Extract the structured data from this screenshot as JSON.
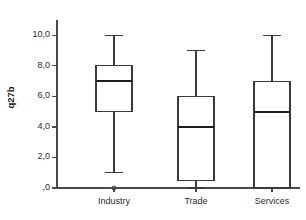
{
  "chart_data": {
    "type": "box",
    "title": "",
    "xlabel": "",
    "ylabel": "q27b",
    "ylim": [
      0,
      11
    ],
    "grid": false,
    "legend": "none",
    "decimal_separator": ",",
    "y_ticks": [
      {
        "value": 10,
        "label": "10,0"
      },
      {
        "value": 8,
        "label": "8,0"
      },
      {
        "value": 6,
        "label": "6,0"
      },
      {
        "value": 4,
        "label": "4,0"
      },
      {
        "value": 2,
        "label": "2,0"
      },
      {
        "value": 0,
        "label": ",0"
      }
    ],
    "categories": [
      "Industry",
      "Trade",
      "Services"
    ],
    "boxes": [
      {
        "category": "Industry",
        "whisker_low": 1.0,
        "q1": 5.0,
        "median": 7.0,
        "q3": 8.0,
        "whisker_high": 10.0,
        "outliers": [
          0.0
        ]
      },
      {
        "category": "Trade",
        "whisker_low": 0.0,
        "q1": 0.5,
        "median": 4.0,
        "q3": 6.0,
        "whisker_high": 9.0,
        "outliers": []
      },
      {
        "category": "Services",
        "whisker_low": 0.0,
        "q1": 0.0,
        "median": 5.0,
        "q3": 7.0,
        "whisker_high": 10.0,
        "outliers": []
      }
    ]
  },
  "axis_title": {
    "y": "q27b"
  },
  "colors": {
    "axis": "#4a4a4a",
    "box_stroke": "#3a3a3a",
    "box_fill": "#ffffff",
    "median": "#1c1c1c",
    "background": "#ffffff"
  }
}
